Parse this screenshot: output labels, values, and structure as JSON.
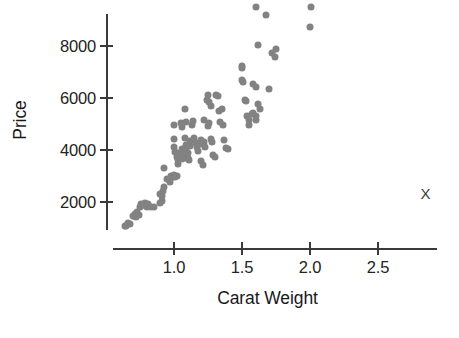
{
  "chart_data": {
    "type": "scatter",
    "title": "",
    "xlabel": "Carat Weight",
    "ylabel": "Price",
    "xlim": [
      0.55,
      2.85
    ],
    "ylim": [
      700,
      9600
    ],
    "grid": false,
    "legend": null,
    "marker": {
      "shape": "circle",
      "color": "#828282",
      "size": 7
    },
    "xticks": [
      1.0,
      1.5,
      2.0,
      2.5
    ],
    "xticklabels": [
      "1.0",
      "1.5",
      "2.0",
      "2.5"
    ],
    "yticks": [
      2000,
      4000,
      6000,
      8000
    ],
    "yticklabels": [
      "2000",
      "4000",
      "6000",
      "8000"
    ],
    "annotations": [
      {
        "text": "X",
        "x": 2.85,
        "y": 2350,
        "name": "x-marker"
      }
    ],
    "points": [
      [
        0.64,
        1090
      ],
      [
        0.65,
        1060
      ],
      [
        0.66,
        1180
      ],
      [
        0.68,
        1150
      ],
      [
        0.7,
        1480
      ],
      [
        0.71,
        1530
      ],
      [
        0.72,
        1430
      ],
      [
        0.73,
        1620
      ],
      [
        0.74,
        1500
      ],
      [
        0.75,
        1820
      ],
      [
        0.76,
        1930
      ],
      [
        0.77,
        1900
      ],
      [
        0.78,
        1870
      ],
      [
        0.79,
        1960
      ],
      [
        0.8,
        1820
      ],
      [
        0.81,
        1930
      ],
      [
        0.83,
        1820
      ],
      [
        0.85,
        1800
      ],
      [
        0.9,
        2300
      ],
      [
        0.91,
        2250
      ],
      [
        0.92,
        2420
      ],
      [
        0.93,
        2560
      ],
      [
        0.9,
        1980
      ],
      [
        0.91,
        2050
      ],
      [
        0.93,
        3290
      ],
      [
        0.95,
        2880
      ],
      [
        0.97,
        2780
      ],
      [
        0.98,
        3000
      ],
      [
        0.99,
        2950
      ],
      [
        1.0,
        3020
      ],
      [
        1.01,
        2960
      ],
      [
        1.02,
        3010
      ],
      [
        1.0,
        4970
      ],
      [
        1.0,
        4430
      ],
      [
        1.0,
        4100
      ],
      [
        1.01,
        3930
      ],
      [
        1.02,
        3880
      ],
      [
        1.02,
        3720
      ],
      [
        1.03,
        3600
      ],
      [
        1.03,
        3450
      ],
      [
        1.04,
        3840
      ],
      [
        1.05,
        3900
      ],
      [
        1.05,
        3750
      ],
      [
        1.06,
        3650
      ],
      [
        1.06,
        4040
      ],
      [
        1.07,
        3900
      ],
      [
        1.07,
        3780
      ],
      [
        1.08,
        3680
      ],
      [
        1.08,
        4470
      ],
      [
        1.09,
        4180
      ],
      [
        1.09,
        3950
      ],
      [
        1.1,
        3870
      ],
      [
        1.1,
        3700
      ],
      [
        1.11,
        3600
      ],
      [
        1.12,
        4350
      ],
      [
        1.12,
        4150
      ],
      [
        1.05,
        5020
      ],
      [
        1.06,
        4900
      ],
      [
        1.08,
        5560
      ],
      [
        1.09,
        5080
      ],
      [
        1.13,
        4950
      ],
      [
        1.14,
        5130
      ],
      [
        1.15,
        4460
      ],
      [
        1.16,
        4280
      ],
      [
        1.17,
        4130
      ],
      [
        1.18,
        3970
      ],
      [
        1.19,
        4240
      ],
      [
        1.2,
        4380
      ],
      [
        1.2,
        3560
      ],
      [
        1.21,
        3440
      ],
      [
        1.22,
        4300
      ],
      [
        1.23,
        4120
      ],
      [
        1.24,
        5940
      ],
      [
        1.25,
        6100
      ],
      [
        1.26,
        5830
      ],
      [
        1.27,
        5700
      ],
      [
        1.25,
        4920
      ],
      [
        1.26,
        5020
      ],
      [
        1.27,
        4420
      ],
      [
        1.28,
        4300
      ],
      [
        1.29,
        3800
      ],
      [
        1.3,
        3740
      ],
      [
        1.31,
        6120
      ],
      [
        1.32,
        6070
      ],
      [
        1.33,
        5490
      ],
      [
        1.35,
        5580
      ],
      [
        1.36,
        4980
      ],
      [
        1.37,
        4380
      ],
      [
        1.38,
        4060
      ],
      [
        1.4,
        4020
      ],
      [
        1.34,
        5060
      ],
      [
        1.22,
        5140
      ],
      [
        1.5,
        7250
      ],
      [
        1.5,
        7160
      ],
      [
        1.5,
        6700
      ],
      [
        1.51,
        6620
      ],
      [
        1.52,
        5920
      ],
      [
        1.53,
        5880
      ],
      [
        1.54,
        5300
      ],
      [
        1.55,
        5160
      ],
      [
        1.55,
        4980
      ],
      [
        1.57,
        5380
      ],
      [
        1.58,
        5440
      ],
      [
        1.6,
        5300
      ],
      [
        1.6,
        5150
      ],
      [
        1.62,
        5770
      ],
      [
        1.63,
        5560
      ],
      [
        1.58,
        6540
      ],
      [
        1.6,
        6420
      ],
      [
        1.62,
        8040
      ],
      [
        1.6,
        9490
      ],
      [
        1.68,
        9200
      ],
      [
        1.72,
        7750
      ],
      [
        1.74,
        7580
      ],
      [
        1.75,
        7900
      ],
      [
        1.7,
        6350
      ],
      [
        2.01,
        9490
      ],
      [
        2.0,
        8750
      ]
    ]
  },
  "axis": {
    "x_axis_name": "x-axis",
    "y_axis_name": "y-axis"
  }
}
